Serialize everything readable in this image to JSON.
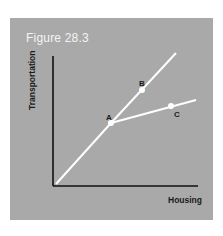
{
  "figure": {
    "title": "Figure 28.3",
    "x_axis_label": "Housing",
    "y_axis_label": "Transportation",
    "points": [
      {
        "label": "A",
        "x": 111,
        "y": 123
      },
      {
        "label": "B",
        "x": 142,
        "y": 91
      },
      {
        "label": "C",
        "x": 171,
        "y": 106
      }
    ],
    "colors": {
      "background": "#a9a9a9",
      "lines": "#ffffff",
      "axes": "#111111",
      "title": "#f4f4f4"
    }
  }
}
